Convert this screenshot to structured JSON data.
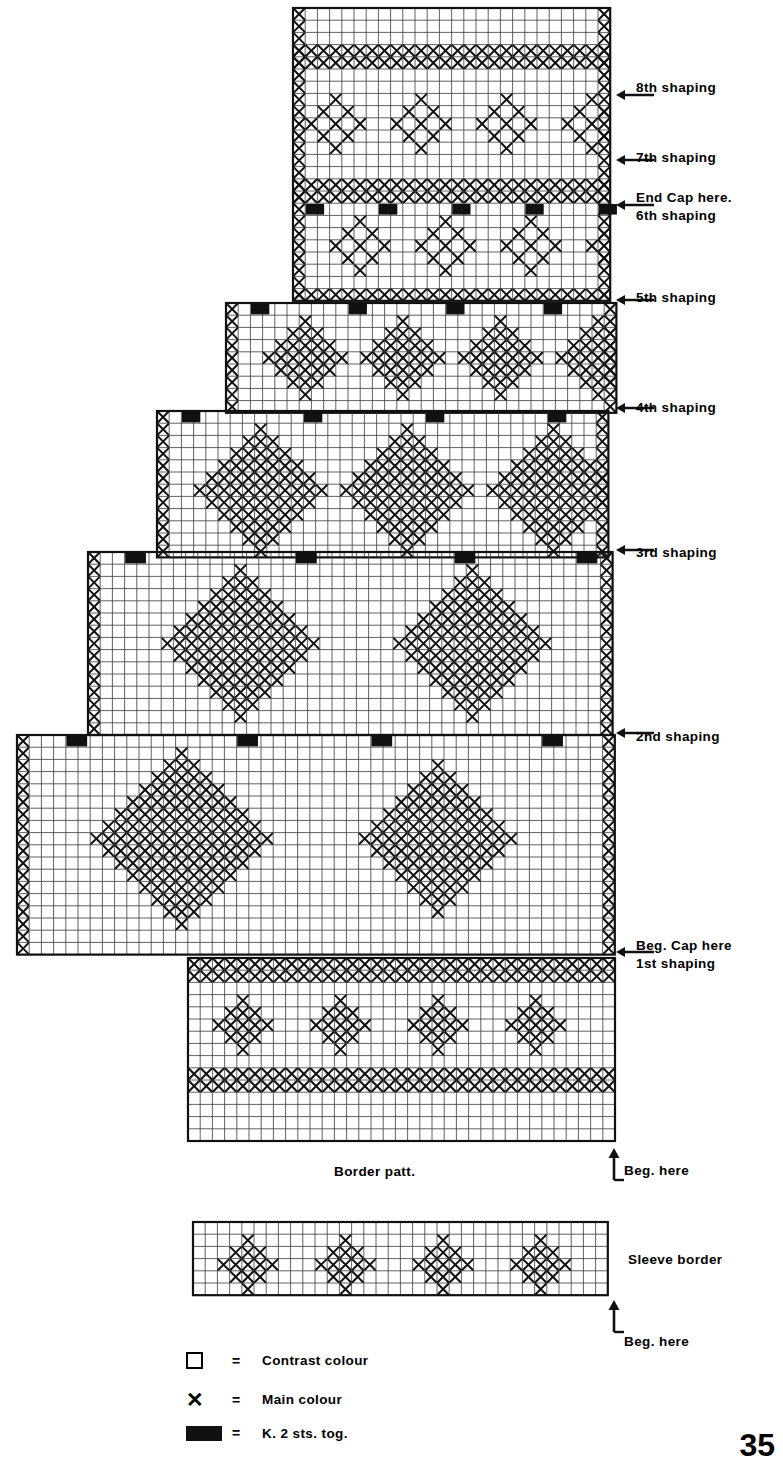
{
  "page": {
    "number": "35"
  },
  "labels": {
    "shaping_8": "8th shaping",
    "shaping_7": "7th shaping",
    "end_cap": "End Cap here.",
    "shaping_6": "6th shaping",
    "shaping_5": "5th shaping",
    "shaping_4": "4th shaping",
    "shaping_3": "3rd shaping",
    "shaping_2": "2nd shaping",
    "beg_cap": "Beg. Cap here",
    "shaping_1": "1st shaping",
    "border_patt": "Border patt.",
    "beg_here_main": "Beg. here",
    "sleeve_border": "Sleeve border",
    "beg_here_sleeve": "Beg. here"
  },
  "legend": [
    {
      "symbol": "open-square",
      "eq": "=",
      "text": "Contrast colour"
    },
    {
      "symbol": "x-mark",
      "eq": "=",
      "text": "Main colour"
    },
    {
      "symbol": "filled-block",
      "eq": "=",
      "text": "K. 2 sts. tog."
    }
  ],
  "colors": {
    "ink": "#111111",
    "grid_line": "#333333",
    "paper": "#ffffff",
    "decrease_block": "#111111"
  },
  "chart_data": {
    "type": "heatmap",
    "cell_px": 12.2,
    "symbols": {
      "blank": "Contrast colour",
      "x": "Main colour",
      "k": "K. 2 sts. tog."
    },
    "main_chart": {
      "right_edge_x": 612,
      "top_y": 8,
      "bottom_y": 1146,
      "columns_at_widest": 49,
      "rows_total": 93,
      "steps": [
        {
          "name": "top",
          "left_x": 293,
          "top_y": 8,
          "bottom_y": 303
        },
        {
          "name": "6th",
          "left_x": 226,
          "top_y": 303,
          "bottom_y": 411
        },
        {
          "name": "5th",
          "left_x": 157,
          "top_y": 411,
          "bottom_y": 552
        },
        {
          "name": "4th",
          "left_x": 88,
          "top_y": 552,
          "bottom_y": 735
        },
        {
          "name": "3rd",
          "left_x": 17,
          "top_y": 735,
          "bottom_y": 960
        },
        {
          "name": "border",
          "left_x": 188,
          "top_y": 958,
          "bottom_y": 1146
        }
      ],
      "shaping_rows_y": [
        95,
        160,
        205,
        300,
        408,
        550,
        733,
        952
      ]
    },
    "sleeve_border": {
      "left_x": 193,
      "right_x": 612,
      "top_y": 1222,
      "bottom_y": 1298,
      "rows": 7,
      "motif_repeat_cols": 9,
      "motifs": 4
    },
    "border_pattern_rows": [
      "dense-x",
      "dense-x",
      "blank",
      "star-motif",
      "star-motif",
      "star-motif",
      "blank",
      "dense-x",
      "dense-x",
      "blank",
      "blank"
    ]
  }
}
